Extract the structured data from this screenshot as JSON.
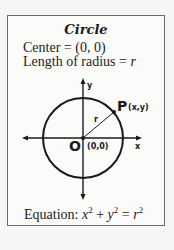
{
  "card": {
    "title": "Circle",
    "center_label": "Center = (0, 0)",
    "radius_label_prefix": "Length of radius = ",
    "radius_symbol": "r"
  },
  "diagram": {
    "center": {
      "x": 83,
      "y": 138
    },
    "radius": 40,
    "point_label": "P",
    "point_coords": "(x,y)",
    "origin_label": "O",
    "origin_coords": "(0,0)",
    "radius_line_label": "r",
    "x_axis_label": "x",
    "y_axis_label": "y",
    "colors": {
      "stroke": "#1a1a1a",
      "border": "#6a6a6a",
      "background": "#fbfbfa"
    }
  },
  "equation": {
    "prefix": "Equation:",
    "x": "x",
    "y": "y",
    "r": "r",
    "exponent": "2",
    "plus": "+",
    "equals": "="
  }
}
